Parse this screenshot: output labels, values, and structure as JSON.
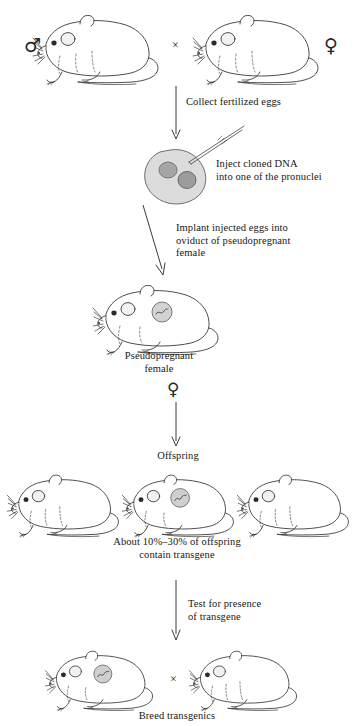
{
  "diagram": {
    "line_color": "#3a3a3a",
    "fill_color": "#ffffff",
    "shade_color": "#d7d7d7",
    "nucleus_color": "#a0a0a0"
  },
  "steps": {
    "collect": "Collect fertilized eggs",
    "inject": "Inject cloned DNA\ninto one of the pronuclei",
    "implant": "Implant injected eggs into\noviduct of pseudopregnant\nfemale",
    "pseudopregnant": "Pseudopregnant\nfemale",
    "offspring": "Offspring",
    "percent": "About 10%–30% of offspring\ncontain transgene",
    "test": "Test for presence\nof transgene",
    "breed": "Breed transgenics"
  },
  "symbols": {
    "male": "♂",
    "female": "♀",
    "cross": "×"
  },
  "parents": {
    "father_label": "♂",
    "mother_label": "♀"
  },
  "offspring_row": {
    "count": 3,
    "transgenic_index": 1
  },
  "breeding_pair": {
    "count": 2,
    "transgenic_index": 0
  }
}
